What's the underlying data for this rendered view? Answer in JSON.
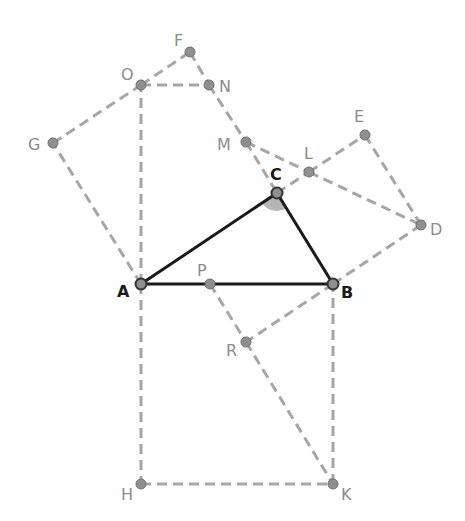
{
  "diagram": {
    "type": "geometry-construction",
    "colors": {
      "triangle": "#1a1a1a",
      "construction": "#a6a6a6",
      "point_fill": "#8f8f8f",
      "point_stroke": "#6e6e6e",
      "angle_fill": "#b5b5b5",
      "label_gray": "#8c8c8c",
      "label_dark": "#1a1a1a"
    },
    "points": {
      "A": {
        "x": 141,
        "y": 284,
        "label": "A",
        "lx": 117,
        "ly": 297,
        "style": "dark"
      },
      "B": {
        "x": 333,
        "y": 284,
        "label": "B",
        "lx": 341,
        "ly": 298,
        "style": "dark"
      },
      "C": {
        "x": 277,
        "y": 193,
        "label": "C",
        "lx": 270,
        "ly": 180,
        "style": "dark"
      },
      "D": {
        "x": 421,
        "y": 225,
        "label": "D",
        "lx": 430,
        "ly": 235,
        "style": "gray"
      },
      "E": {
        "x": 365,
        "y": 135,
        "label": "E",
        "lx": 354,
        "ly": 122,
        "style": "gray"
      },
      "F": {
        "x": 190,
        "y": 52,
        "label": "F",
        "lx": 174,
        "ly": 46,
        "style": "gray"
      },
      "G": {
        "x": 53,
        "y": 143,
        "label": "G",
        "lx": 28,
        "ly": 150,
        "style": "gray"
      },
      "H": {
        "x": 141,
        "y": 484,
        "label": "H",
        "lx": 121,
        "ly": 500,
        "style": "gray"
      },
      "K": {
        "x": 333,
        "y": 484,
        "label": "K",
        "lx": 341,
        "ly": 500,
        "style": "gray"
      },
      "L": {
        "x": 309,
        "y": 172,
        "label": "L",
        "lx": 304,
        "ly": 159,
        "style": "gray"
      },
      "M": {
        "x": 246,
        "y": 142,
        "label": "M",
        "lx": 217,
        "ly": 150,
        "style": "gray"
      },
      "N": {
        "x": 209,
        "y": 85,
        "label": "N",
        "lx": 219,
        "ly": 92,
        "style": "gray"
      },
      "O": {
        "x": 141,
        "y": 85,
        "label": "O",
        "lx": 121,
        "ly": 80,
        "style": "gray"
      },
      "P": {
        "x": 210,
        "y": 284,
        "label": "P",
        "lx": 197,
        "ly": 276,
        "style": "gray"
      },
      "R": {
        "x": 246,
        "y": 342,
        "label": "R",
        "lx": 226,
        "ly": 356,
        "style": "gray"
      }
    },
    "triangle_edges": [
      [
        "A",
        "B"
      ],
      [
        "B",
        "C"
      ],
      [
        "C",
        "A"
      ]
    ],
    "dashed_edges": [
      [
        "A",
        "O"
      ],
      [
        "O",
        "N"
      ],
      [
        "O",
        "F"
      ],
      [
        "F",
        "N"
      ],
      [
        "N",
        "M"
      ],
      [
        "M",
        "C"
      ],
      [
        "A",
        "G"
      ],
      [
        "G",
        "O"
      ],
      [
        "C",
        "L"
      ],
      [
        "L",
        "E"
      ],
      [
        "E",
        "D"
      ],
      [
        "D",
        "B"
      ],
      [
        "M",
        "L"
      ],
      [
        "L",
        "D"
      ],
      [
        "A",
        "H"
      ],
      [
        "H",
        "K"
      ],
      [
        "K",
        "B"
      ],
      [
        "P",
        "R"
      ],
      [
        "R",
        "K"
      ],
      [
        "B",
        "R"
      ]
    ],
    "angle_marker": {
      "vertex": "C",
      "from": "A",
      "to": "B",
      "radius": 18
    }
  }
}
